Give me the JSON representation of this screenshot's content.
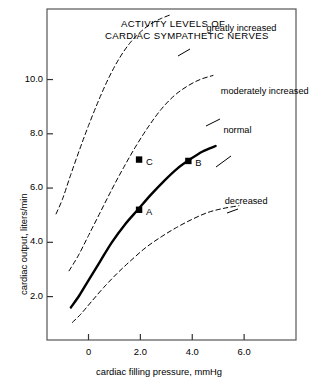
{
  "figure": {
    "title_lines": [
      "ACTIVITY LEVELS OF",
      "CARDIAC SYMPATHETIC NERVES"
    ],
    "background": "#ffffff",
    "frame_color": "#555555"
  },
  "chart_data": {
    "type": "line",
    "title": "ACTIVITY LEVELS OF CARDIAC SYMPATHETIC NERVES",
    "xlabel": "cardiac filling pressure, mmHg",
    "ylabel": "cardiac output, liters/min",
    "xlim": [
      -1.6,
      8.0
    ],
    "ylim": [
      0.4,
      12.6
    ],
    "xticks": [
      0,
      2.0,
      4.0,
      6.0
    ],
    "xticklabels": [
      "0",
      "2.0",
      "4.0",
      "6.0"
    ],
    "yticks": [
      2.0,
      4.0,
      6.0,
      8.0,
      10.0
    ],
    "yticklabels": [
      "2.0",
      "4.0",
      "6.0",
      "8.0",
      "10.0"
    ],
    "grid": false,
    "legend_position": "inline-annotations",
    "series": [
      {
        "name": "greatly increased",
        "style": "dashed",
        "color": "#000000",
        "label": "greatly increased",
        "label_x": 4.55,
        "label_y": 11.85,
        "x": [
          -1.25,
          -1.0,
          -0.7,
          -0.35,
          0.0,
          0.4,
          0.8,
          1.2,
          1.6,
          2.0,
          2.4,
          2.8,
          3.2
        ],
        "y": [
          5.05,
          5.6,
          6.45,
          7.4,
          8.3,
          9.25,
          10.1,
          10.8,
          11.35,
          11.75,
          12.05,
          12.25,
          12.4
        ]
      },
      {
        "name": "moderately increased",
        "style": "dashed",
        "color": "#000000",
        "label": "moderately increased",
        "label_x": 5.1,
        "label_y": 9.55,
        "x": [
          -0.75,
          -0.4,
          0.0,
          0.45,
          0.9,
          1.35,
          1.8,
          2.3,
          2.8,
          3.3,
          3.8,
          4.3,
          4.8
        ],
        "y": [
          2.95,
          3.5,
          4.25,
          5.1,
          5.95,
          6.75,
          7.5,
          8.25,
          8.9,
          9.4,
          9.75,
          10.0,
          10.15
        ]
      },
      {
        "name": "normal",
        "style": "solid",
        "color": "#000000",
        "label": "normal",
        "label_x": 5.2,
        "label_y": 8.1,
        "x": [
          -0.68,
          -0.35,
          0.0,
          0.45,
          0.9,
          1.4,
          1.9,
          2.4,
          2.9,
          3.4,
          3.9,
          4.4,
          4.9
        ],
        "y": [
          1.6,
          2.05,
          2.6,
          3.3,
          4.0,
          4.65,
          5.2,
          5.75,
          6.25,
          6.7,
          7.05,
          7.35,
          7.55
        ]
      },
      {
        "name": "decreased",
        "style": "dashed",
        "color": "#000000",
        "label": "decreased",
        "label_x": 5.25,
        "label_y": 5.5,
        "x": [
          -0.62,
          -0.3,
          0.1,
          0.6,
          1.1,
          1.6,
          2.2,
          2.8,
          3.4,
          4.0,
          4.6,
          5.2,
          5.8
        ],
        "y": [
          1.05,
          1.35,
          1.8,
          2.35,
          2.85,
          3.3,
          3.8,
          4.2,
          4.55,
          4.85,
          5.1,
          5.25,
          5.35
        ]
      }
    ],
    "points": [
      {
        "label": "A",
        "x": 1.95,
        "y": 5.2,
        "label_dx": 7,
        "label_dy": 9
      },
      {
        "label": "B",
        "x": 3.85,
        "y": 7.0,
        "label_dx": 7,
        "label_dy": 9
      },
      {
        "label": "C",
        "x": 1.95,
        "y": 7.05,
        "label_dx": 7,
        "label_dy": 9
      }
    ]
  }
}
